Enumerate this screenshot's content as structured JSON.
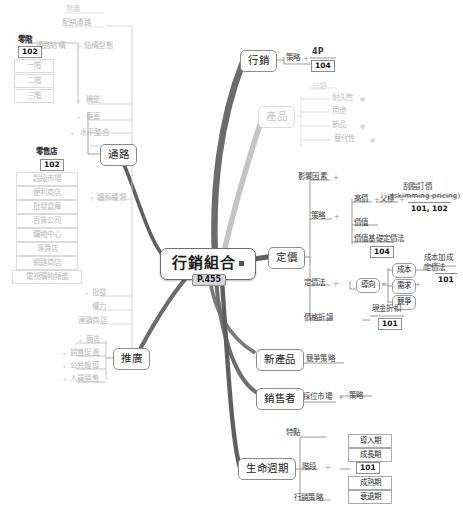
{
  "center": {
    "label": "行銷組合",
    "page": "P.455"
  },
  "branches": {
    "marketing": {
      "label": "行銷",
      "strategy_label": "策略",
      "item": "4P",
      "ref": "104"
    },
    "product": {
      "label": "產品",
      "group_label": "分類",
      "items": [
        "耐久性",
        "用途",
        "新品",
        "替代性"
      ]
    },
    "channel": {
      "label": "通路",
      "top_items": [
        "無義",
        "配銷通路"
      ],
      "structure_label": "通路結構",
      "structure_type_label": "結構型態",
      "levels_header": "零階",
      "levels_ref": "102",
      "levels": [
        "一階",
        "二階",
        "三階"
      ],
      "features": [
        "機能",
        "垂直",
        "水平整合"
      ],
      "retail_group_label": "體系種類",
      "retail_header": "零售店",
      "retail_ref": "102",
      "retail_items": [
        "超級市場",
        "便利商店",
        "批發倉庫",
        "百貨公司",
        "購物中心",
        "專賣店",
        "網路商店",
        "電視購物頻道"
      ],
      "extra_items": [
        "批發",
        "權力",
        "連鎖商店"
      ]
    },
    "promotion": {
      "label": "推廣",
      "items": [
        "廣告",
        "銷售促進",
        "公共報導",
        "人員銷售"
      ]
    },
    "pricing": {
      "label": "定價",
      "factors_label": "影響因素",
      "strategy_label": "策略",
      "strategy_items": [
        "高價",
        "父標",
        "價值",
        "價值基礎定價法"
      ],
      "strategy_ref": "104",
      "skimming_label": "刮脂訂價",
      "skimming_en": "(skimming pricing)",
      "skimming_ref": "101, 102",
      "method_label": "定價法",
      "orientation_label": "導向",
      "orientation_items": [
        "成本",
        "需求",
        "競爭"
      ],
      "cost_plus_label": "成本加成\n定價法",
      "cost_plus_line1": "成本加成",
      "cost_plus_line2": "定價法",
      "cost_plus_ref": "101",
      "discount_label": "價格折讓",
      "discount_item": "現金折扣",
      "discount_ref": "101"
    },
    "new_product": {
      "label": "新產品",
      "item": "競爭策略"
    },
    "seller": {
      "label": "銷售者",
      "item": "採位市場",
      "sub_item": "策略"
    },
    "lifecycle": {
      "label": "生命週期",
      "features_label": "特點",
      "stages_label": "階段",
      "stages": [
        "導入期",
        "成長期",
        "成熟期",
        "衰退期"
      ],
      "stages_ref": "101",
      "strategy_label": "行銷策略"
    }
  },
  "colors": {
    "wire_dark": "#6b6b6b",
    "wire_mid": "#8f8f8f",
    "wire_light": "#c4c4c4",
    "node_border": "#8c8c8c",
    "badge_bg": "#d7d7d7"
  }
}
